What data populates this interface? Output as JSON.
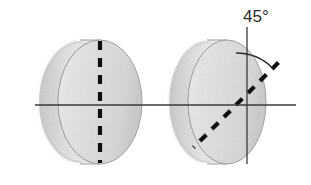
{
  "figure": {
    "title": "",
    "background_color": "#ffffff",
    "width": 311,
    "height": 185,
    "axis": {
      "name": "horizontal-optic-axis",
      "color": "#3a3a3a",
      "y": 105,
      "x_start": 35,
      "x_end": 296,
      "stroke_width": 1.4
    },
    "disks": [
      {
        "id": "left-disk",
        "label": "",
        "center_x": 100,
        "center_y": 102,
        "rx": 42,
        "ry": 62,
        "face_offset": -20,
        "body_color": "#e3e3e3",
        "edge_color": "#b0b0b0",
        "highlight_color": "#fafafa",
        "marker": {
          "type": "dashed-line",
          "orientation_deg": 0,
          "color": "#101010",
          "length": 124,
          "stroke_width": 4.2,
          "dash": "9 8"
        }
      },
      {
        "id": "right-disk",
        "label": "",
        "center_x": 227,
        "center_y": 102,
        "rx": 39,
        "ry": 62,
        "face_offset": -20,
        "body_color": "#e3e3e3",
        "edge_color": "#b0b0b0",
        "highlight_color": "#fafafa",
        "marker": {
          "type": "dashed-line",
          "orientation_deg": 45,
          "color": "#101010",
          "length": 124,
          "stroke_width": 4.2,
          "dash": "9 8"
        }
      }
    ],
    "reference_line": {
      "name": "vertical-reference-line",
      "color": "#3a3a3a",
      "x": 247,
      "y_top": 27,
      "y_bottom": 164,
      "stroke_width": 1.3
    },
    "angle_arc": {
      "name": "angle-arc",
      "color": "#2b2b2b",
      "center_x": 236,
      "center_y": 105,
      "radius": 52,
      "start_deg": 0,
      "end_deg": 45,
      "stroke_width": 1.4
    },
    "angle_label": {
      "name": "angle-label",
      "text": "45°",
      "x": 243,
      "y": 22,
      "color": "#2b2b2b",
      "font_size": 17
    }
  }
}
